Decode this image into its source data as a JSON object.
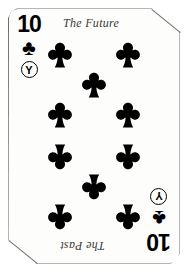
{
  "card": {
    "rank": "10",
    "suit_name": "clubs",
    "suit_glyph": "♣",
    "badge_letter": "Y",
    "top_label": "The Future",
    "bottom_label": "The Past",
    "face_color": "#fdfdfc",
    "ink_color": "#000000",
    "border_color": "#6e6e6e",
    "label_color": "#3a3a3a"
  },
  "indices": {
    "top_left": {
      "rank": "10",
      "suit_glyph": "♣",
      "badge_letter": "Y"
    },
    "bottom_right": {
      "rank": "10",
      "suit_glyph": "♣",
      "badge_letter": "Y"
    }
  },
  "pips": {
    "count": 10,
    "upright": [
      {
        "x": 52,
        "y": 48
      },
      {
        "x": 120,
        "y": 48
      },
      {
        "x": 86,
        "y": 78
      },
      {
        "x": 52,
        "y": 108
      },
      {
        "x": 120,
        "y": 108
      }
    ],
    "inverted": [
      {
        "x": 52,
        "y": 148
      },
      {
        "x": 120,
        "y": 148
      },
      {
        "x": 86,
        "y": 178
      },
      {
        "x": 52,
        "y": 208
      },
      {
        "x": 120,
        "y": 208
      }
    ]
  }
}
